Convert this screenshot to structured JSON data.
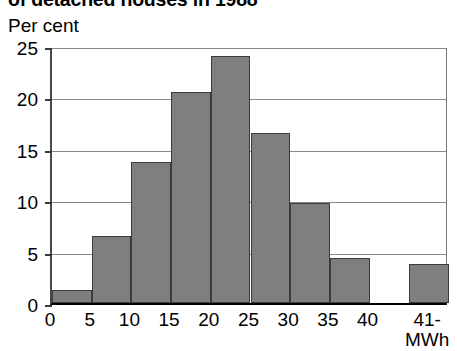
{
  "chart_data": {
    "type": "bar",
    "title": "of detached houses in 1988",
    "subtitle": "",
    "ylabel": "Per cent",
    "xlabel": "MWh",
    "categories": [
      "0-5",
      "5-10",
      "10-15",
      "15-20",
      "20-25",
      "25-30",
      "30-35",
      "35-40",
      "40-41",
      "41-"
    ],
    "values": [
      1.3,
      6.5,
      13.7,
      20.5,
      24.0,
      16.5,
      9.7,
      4.4,
      0,
      3.8
    ],
    "xtick_labels": [
      "0",
      "5",
      "10",
      "15",
      "20",
      "25",
      "30",
      "35",
      "40",
      "41-"
    ],
    "ytick_labels": [
      "0",
      "5",
      "10",
      "15",
      "20",
      "25"
    ],
    "ytick_values": [
      0,
      5,
      10,
      15,
      20,
      25
    ],
    "ylim": [
      0,
      25
    ],
    "xlim": [
      0,
      45
    ],
    "grid": true,
    "legend": false,
    "bar_color": "#807f80",
    "bar_edge_color": "#3b3b3b",
    "axis_color": "#000000",
    "grid_color": "#8a8a8a",
    "background": "#ffffff"
  }
}
